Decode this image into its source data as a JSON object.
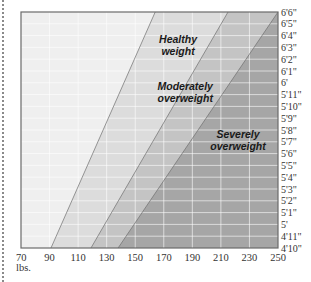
{
  "chart_data": {
    "type": "area",
    "title": "",
    "xlabel": "lbs.",
    "ylabel": "",
    "xlim": [
      70,
      250
    ],
    "ylim_inches": [
      58,
      78
    ],
    "grid": true,
    "x_ticks": [
      "70",
      "90",
      "110",
      "130",
      "150",
      "170",
      "190",
      "210",
      "230",
      "250"
    ],
    "x_unit_label": "lbs.",
    "y_ticks": [
      "4'10\"",
      "4'11\"",
      "5'",
      "5'1\"",
      "5'2\"",
      "5'3\"",
      "5'4\"",
      "5'5\"",
      "5'6\"",
      "5'7\"",
      "5'8\"",
      "5'9\"",
      "5'10\"",
      "5'11\"",
      "6'",
      "6'1\"",
      "6'2\"",
      "6'3\"",
      "6'4\"",
      "6'5\"",
      "6'6\""
    ],
    "y_tick_inches": [
      58,
      59,
      60,
      61,
      62,
      63,
      64,
      65,
      66,
      67,
      68,
      69,
      70,
      71,
      72,
      73,
      74,
      75,
      76,
      77,
      78
    ],
    "boundaries": [
      {
        "name": "healthy_lower",
        "points": [
          [
            91,
            58
          ],
          [
            164,
            78
          ]
        ]
      },
      {
        "name": "moderate_lower",
        "points": [
          [
            119,
            58
          ],
          [
            215,
            78
          ]
        ]
      },
      {
        "name": "severe_lower",
        "points": [
          [
            138,
            58
          ],
          [
            250,
            78
          ]
        ]
      }
    ],
    "zones": [
      {
        "name": "Underweight",
        "color": "#efefef"
      },
      {
        "name": "Healthy weight",
        "color": "#dcdcdc"
      },
      {
        "name": "Moderately overweight",
        "color": "#c4c4c4"
      },
      {
        "name": "Severely overweight",
        "color": "#a6a6a6"
      }
    ],
    "annotations": [
      {
        "text_lines": [
          "Healthy",
          "weight"
        ],
        "x_lbs": 180,
        "y_in": 75.4
      },
      {
        "text_lines": [
          "Moderately",
          "overweight"
        ],
        "x_lbs": 185,
        "y_in": 71.4
      },
      {
        "text_lines": [
          "Severely",
          "overweight"
        ],
        "x_lbs": 222,
        "y_in": 67.3
      }
    ]
  }
}
